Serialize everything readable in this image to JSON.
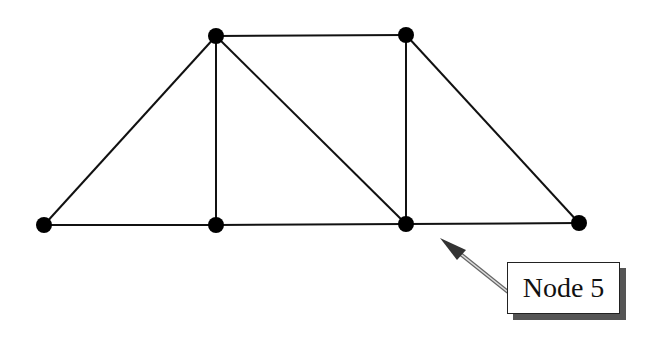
{
  "diagram": {
    "type": "truss",
    "nodes": [
      {
        "id": 1,
        "x": 44,
        "y": 225
      },
      {
        "id": 2,
        "x": 216,
        "y": 225
      },
      {
        "id": 3,
        "x": 216,
        "y": 36
      },
      {
        "id": 4,
        "x": 406,
        "y": 35
      },
      {
        "id": 5,
        "x": 406,
        "y": 224
      },
      {
        "id": 6,
        "x": 579,
        "y": 223
      }
    ],
    "members": [
      [
        1,
        2
      ],
      [
        2,
        5
      ],
      [
        5,
        6
      ],
      [
        1,
        3
      ],
      [
        3,
        2
      ],
      [
        3,
        4
      ],
      [
        3,
        5
      ],
      [
        4,
        5
      ],
      [
        4,
        6
      ]
    ],
    "callout": {
      "label": "Node 5",
      "target_node": 5
    },
    "colors": {
      "line": "#111111",
      "node": "#000000",
      "shadow": "#555555",
      "arrow": "#444444"
    }
  }
}
